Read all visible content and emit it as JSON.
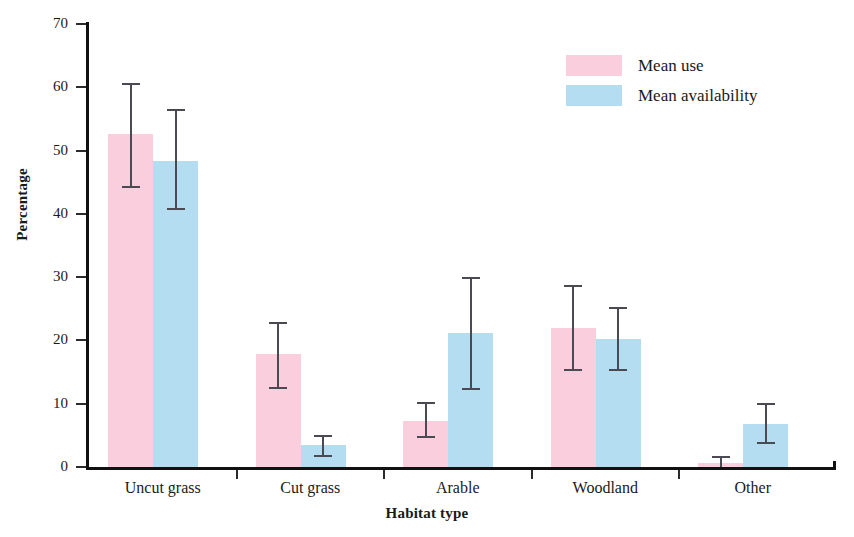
{
  "chart_data": {
    "type": "bar",
    "title": "",
    "xlabel": "Habitat type",
    "ylabel": "Percentage",
    "ylim": [
      0,
      70
    ],
    "yticks": [
      0,
      10,
      20,
      30,
      40,
      50,
      60,
      70
    ],
    "grid": false,
    "legend_position": "top-right",
    "categories": [
      "Uncut grass",
      "Cut grass",
      "Arable",
      "Woodland",
      "Other"
    ],
    "series": [
      {
        "name": "Mean use",
        "color": "#fbcede",
        "values": [
          52.6,
          17.9,
          7.2,
          22.0,
          0.6
        ],
        "err_low": [
          44.4,
          12.7,
          4.9,
          15.5,
          0.0
        ],
        "err_high": [
          60.6,
          22.9,
          10.2,
          28.8,
          1.7
        ]
      },
      {
        "name": "Mean availability",
        "color": "#b5ddf2",
        "values": [
          48.4,
          3.4,
          21.1,
          20.3,
          6.8
        ],
        "err_low": [
          41.0,
          1.9,
          12.5,
          15.5,
          4.0
        ],
        "err_high": [
          56.6,
          5.1,
          30.1,
          25.3,
          10.1
        ]
      }
    ]
  },
  "axes": {
    "y_title": "Percentage",
    "x_title": "Habitat type",
    "y_tick_labels": [
      "0",
      "10",
      "20",
      "30",
      "40",
      "50",
      "60",
      "70"
    ],
    "x_tick_labels": [
      "Uncut grass",
      "Cut grass",
      "Arable",
      "Woodland",
      "Other"
    ]
  },
  "legend": {
    "entries": [
      {
        "label": "Mean use",
        "color": "#fbcede"
      },
      {
        "label": "Mean availability",
        "color": "#b5ddf2"
      }
    ]
  },
  "style": {
    "axis_color": "#111111",
    "error_bar_color": "#4a4a52",
    "background": "#ffffff"
  }
}
